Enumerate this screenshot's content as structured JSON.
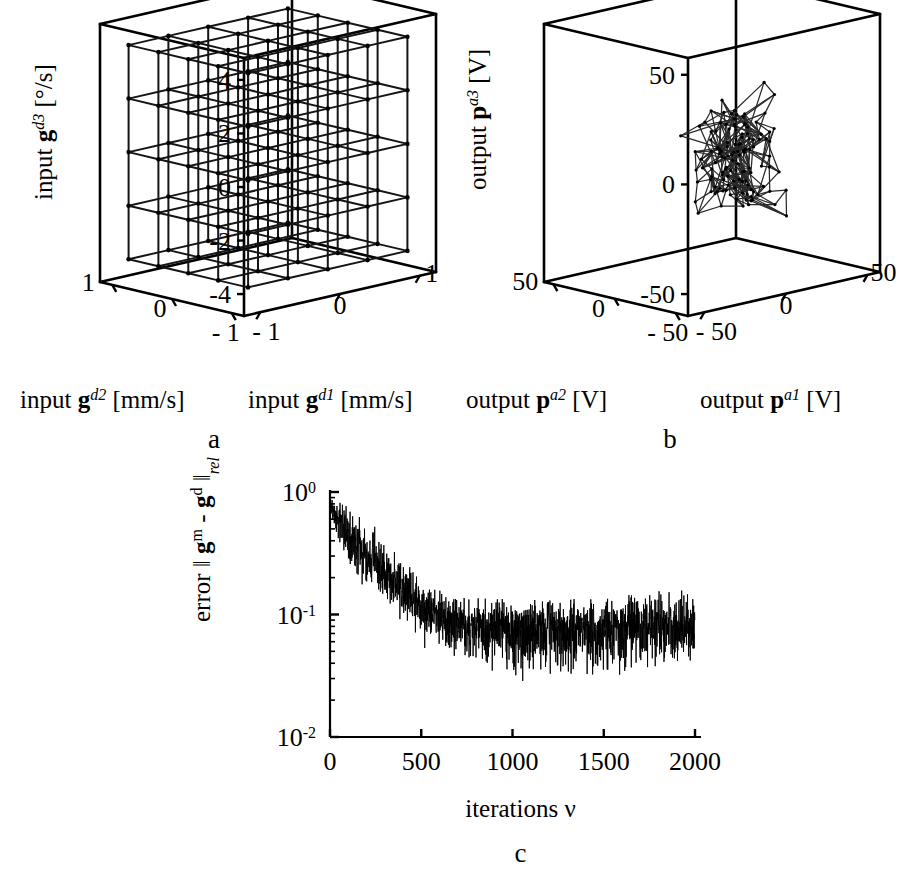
{
  "figure": {
    "panel_letters": [
      "a",
      "b",
      "c"
    ]
  },
  "panel_a": {
    "letter": "a",
    "z_axis": {
      "prefix": "input ",
      "symbol": "g",
      "superscript": "d3",
      "units": " [°/s]",
      "ticks": [
        "4",
        "2",
        "0",
        "-2",
        "-4"
      ],
      "tick_values": [
        4,
        2,
        0,
        -2,
        -4
      ],
      "range": [
        -5,
        5
      ]
    },
    "x_axis": {
      "prefix": "input ",
      "symbol": "g",
      "superscript": "d1",
      "units": " [mm/s]",
      "ticks": [
        "- 1",
        "0",
        "1"
      ],
      "tick_values": [
        -1,
        0,
        1
      ],
      "range": [
        -1.25,
        1.25
      ]
    },
    "y_axis": {
      "prefix": "input ",
      "symbol": "g",
      "superscript": "d2",
      "units": " [mm/s]",
      "ticks": [
        "1",
        "0",
        "- 1"
      ],
      "tick_values": [
        1,
        0,
        -1
      ],
      "range": [
        -1.25,
        1.25
      ]
    }
  },
  "panel_b": {
    "letter": "b",
    "z_axis": {
      "prefix": "output ",
      "symbol": "p",
      "superscript": "a3",
      "units": " [V]",
      "ticks": [
        "50",
        "0",
        "-50"
      ],
      "tick_values": [
        50,
        0,
        -50
      ],
      "range": [
        -62,
        62
      ]
    },
    "x_axis": {
      "prefix": "output ",
      "symbol": "p",
      "superscript": "a1",
      "units": " [V]",
      "ticks": [
        "- 50",
        "0",
        "50"
      ],
      "tick_values": [
        -50,
        0,
        50
      ],
      "range": [
        -62,
        62
      ]
    },
    "y_axis": {
      "prefix": "output ",
      "symbol": "p",
      "superscript": "a2",
      "units": " [V]",
      "ticks": [
        "50",
        "0",
        "- 50"
      ],
      "tick_values": [
        50,
        0,
        -50
      ],
      "range": [
        -62,
        62
      ]
    }
  },
  "panel_c": {
    "letter": "c",
    "y_label": {
      "prefix": "error ",
      "norm_open": "‖ ",
      "sym1": "g",
      "sup1": "m",
      "minus": " - ",
      "sym2": "g",
      "sup2": "d",
      "norm_close": " ‖",
      "sub": "rel"
    },
    "x_label": "iterations ν",
    "y_ticks": [
      {
        "label_base": "10",
        "label_exp": "0",
        "value": 1
      },
      {
        "label_base": "10",
        "label_exp": "-1",
        "value": 0.1
      },
      {
        "label_base": "10",
        "label_exp": "-2",
        "value": 0.01
      }
    ],
    "x_ticks": [
      "0",
      "500",
      "1000",
      "1500",
      "2000"
    ],
    "x_tick_values": [
      0,
      500,
      1000,
      1500,
      2000
    ]
  },
  "chart_data": [
    {
      "type": "scatter",
      "id": "panel-a-lattice",
      "title": "",
      "subtitle": "Desired input grid (regular 3D lattice)",
      "projection": "3d-wireframe",
      "xlabel": "input g^d1 [mm/s]",
      "ylabel": "input g^d2 [mm/s]",
      "zlabel": "input g^d3 [°/s]",
      "xlim": [
        -1.25,
        1.25
      ],
      "ylim": [
        -1.25,
        1.25
      ],
      "zlim": [
        -5,
        5
      ],
      "xticks": [
        -1,
        0,
        1
      ],
      "yticks": [
        -1,
        0,
        1
      ],
      "zticks": [
        -4,
        -2,
        0,
        2,
        4
      ],
      "grid": false,
      "legend": "none",
      "lattice": {
        "nx": 5,
        "ny": 5,
        "nz": 5,
        "x_values": [
          -1,
          -0.5,
          0,
          0.5,
          1
        ],
        "y_values": [
          -1,
          -0.5,
          0,
          0.5,
          1
        ],
        "z_values": [
          -4,
          -2,
          0,
          2,
          4
        ],
        "description": "5x5x5 regular grid of sample points connected by axis-aligned edges"
      }
    },
    {
      "type": "scatter",
      "id": "panel-b-mesh",
      "title": "",
      "subtitle": "Measured output cloud (distorted lattice)",
      "projection": "3d-wireframe",
      "xlabel": "output p^a1 [V]",
      "ylabel": "output p^a2 [V]",
      "zlabel": "output p^a3 [V]",
      "xlim": [
        -62,
        62
      ],
      "ylim": [
        -62,
        62
      ],
      "zlim": [
        -62,
        62
      ],
      "xticks": [
        -50,
        0,
        50
      ],
      "yticks": [
        -50,
        0,
        50
      ],
      "zticks": [
        -50,
        0,
        50
      ],
      "grid": false,
      "legend": "none",
      "cloud": {
        "nx": 5,
        "ny": 5,
        "nz": 5,
        "center": [
          5,
          0,
          -8
        ],
        "spread": [
          14,
          14,
          20
        ],
        "jitter": 9,
        "description": "same 5x5x5 topology, nodes strongly displaced and compressed toward plot centre"
      }
    },
    {
      "type": "line",
      "id": "panel-c-error",
      "title": "",
      "xlabel": "iterations ν",
      "ylabel": "error || g^m - g^d ||_rel",
      "yscale": "log",
      "xlim": [
        0,
        2000
      ],
      "ylim": [
        0.01,
        1
      ],
      "xticks": [
        0,
        500,
        1000,
        1500,
        2000
      ],
      "yticks": [
        0.01,
        0.1,
        1
      ],
      "ytick_labels": [
        "10^-2",
        "10^-1",
        "10^0"
      ],
      "grid": false,
      "legend": "none",
      "series": [
        {
          "name": "relative input error",
          "n_points": 2000,
          "envelope_x": [
            0,
            50,
            100,
            200,
            300,
            400,
            500,
            600,
            700,
            800,
            1000,
            1200,
            1400,
            1600,
            1800,
            2000
          ],
          "envelope_mean": [
            0.82,
            0.6,
            0.45,
            0.3,
            0.22,
            0.155,
            0.115,
            0.095,
            0.085,
            0.08,
            0.078,
            0.075,
            0.075,
            0.076,
            0.078,
            0.078
          ],
          "envelope_upper": [
            0.95,
            0.88,
            0.72,
            0.55,
            0.4,
            0.27,
            0.185,
            0.15,
            0.135,
            0.128,
            0.125,
            0.125,
            0.13,
            0.135,
            0.15,
            0.14
          ],
          "envelope_lower": [
            0.62,
            0.4,
            0.27,
            0.17,
            0.12,
            0.085,
            0.06,
            0.052,
            0.048,
            0.045,
            0.03,
            0.035,
            0.035,
            0.035,
            0.04,
            0.045
          ],
          "start_value": 0.9,
          "plateau_value": 0.078,
          "plateau_start_iteration": 600
        }
      ]
    }
  ]
}
